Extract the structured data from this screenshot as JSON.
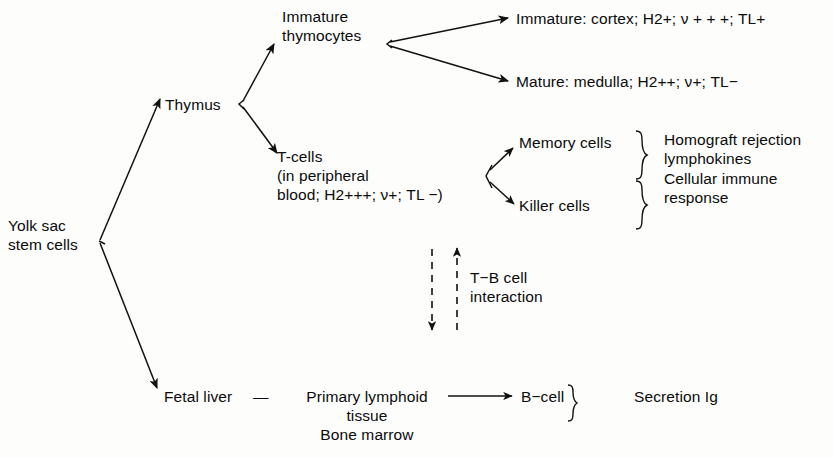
{
  "diagram": {
    "stroke_color": "#111111",
    "background_color": "#fdfdfb",
    "text_color": "#0b0b0b",
    "nodes": {
      "yolk_sac": "Yolk sac\nstem cells",
      "thymus": "Thymus",
      "immature_thymocytes": "Immature\nthymocytes",
      "immature_cortex": "Immature: cortex; H2+; ν + + +; TL+",
      "mature_medulla": "Mature: medulla; H2++; ν+; TL−",
      "t_cells": "T-cells\n(in peripheral\nblood; H2+++; ν+; TL −)",
      "memory_cells": "Memory cells",
      "killer_cells": "Killer cells",
      "homograft": "Homograft rejection\nlymphokines",
      "cellular_immune": "Cellular immune\nresponse",
      "tb_interaction": "T−B cell\ninteraction",
      "fetal_liver": "Fetal liver",
      "dash_connector": "—",
      "primary_lymphoid": "Primary lymphoid\ntissue\nBone marrow",
      "b_cell": "B−cell",
      "secretion_ig": "Secretion Ig"
    },
    "edges": [
      {
        "name": "yolk-sac-to-thymus",
        "style": "solid",
        "arrow": "end"
      },
      {
        "name": "yolk-sac-to-fetal-liver",
        "style": "solid",
        "arrow": "end"
      },
      {
        "name": "thymus-to-immature-thymocytes",
        "style": "solid",
        "arrow": "end"
      },
      {
        "name": "thymus-to-t-cells",
        "style": "solid",
        "arrow": "end"
      },
      {
        "name": "thymocytes-to-immature-cortex",
        "style": "solid",
        "arrow": "end"
      },
      {
        "name": "thymocytes-to-mature-medulla",
        "style": "solid",
        "arrow": "end"
      },
      {
        "name": "t-cells-to-memory-cells",
        "style": "solid",
        "arrow": "end"
      },
      {
        "name": "t-cells-to-killer-cells",
        "style": "solid",
        "arrow": "end"
      },
      {
        "name": "t-to-b-dashed-down",
        "style": "dashed",
        "arrow": "end"
      },
      {
        "name": "b-to-t-dashed-up",
        "style": "dashed",
        "arrow": "end"
      },
      {
        "name": "primary-lymphoid-to-b-cell",
        "style": "solid",
        "arrow": "end"
      }
    ]
  }
}
